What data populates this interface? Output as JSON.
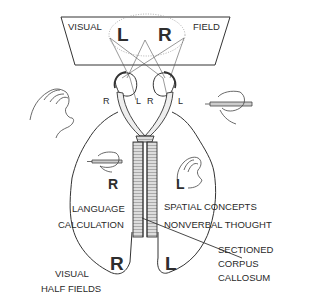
{
  "visual_field": {
    "left_label": "VISUAL",
    "right_label": "FIELD",
    "left_letter": "L",
    "right_letter": "R"
  },
  "eyes": {
    "left_eye_outer": "R",
    "left_eye_inner": "L",
    "right_eye_inner": "R",
    "right_eye_outer": "L"
  },
  "hemispheres": {
    "left_side_letter_upper": "R",
    "right_side_letter_upper": "L",
    "left_side_letter_lower": "R",
    "right_side_letter_lower": "L",
    "left_functions": [
      "LANGUAGE",
      "CALCULATION"
    ],
    "right_functions": [
      "SPATIAL CONCEPTS",
      "NONVERBAL THOUGHT"
    ]
  },
  "callouts": {
    "visual_half_fields": [
      "VISUAL",
      "HALF FIELDS"
    ],
    "sectioned_corpus_callosum": [
      "SECTIONED",
      "CORPUS",
      "CALLOSUM"
    ]
  },
  "icons": {
    "left_outer_hand": "open-hand-icon",
    "right_outer_hand": "writing-hand-icon",
    "left_inner_hand": "writing-hand-icon",
    "right_inner_hand": "open-hand-icon"
  },
  "colors": {
    "line": "#333333",
    "text": "#2a2a2a",
    "background": "#ffffff"
  }
}
